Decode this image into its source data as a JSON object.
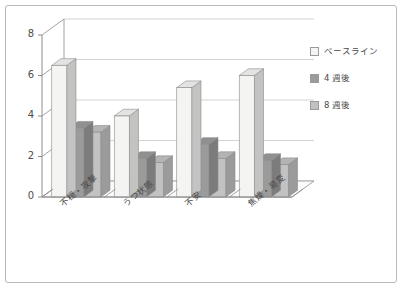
{
  "chart_data": {
    "type": "bar",
    "title": "",
    "subtitle": "",
    "xlabel": "",
    "ylabel": "",
    "ylim": [
      0,
      8
    ],
    "ytick_labels": [
      "0",
      "2",
      "4",
      "6",
      "8"
    ],
    "yticks": [
      0,
      2,
      4,
      6,
      8
    ],
    "grid": true,
    "legend_position": "right",
    "three_d": true,
    "categories": [
      "不穏・攻撃",
      "うつ状態",
      "不安",
      "焦燥・易変"
    ],
    "series": [
      {
        "name": "ベースライン",
        "color": "#f4f4f2",
        "values": [
          6.5,
          4.0,
          5.4,
          6.0
        ]
      },
      {
        "name": "4 週後",
        "color": "#9b9b9b",
        "values": [
          3.4,
          1.9,
          2.6,
          1.8
        ]
      },
      {
        "name": "8 週後",
        "color": "#c2c2c2",
        "values": [
          3.2,
          1.7,
          1.9,
          1.6
        ]
      }
    ]
  },
  "legend": {
    "items": [
      {
        "label": "ベースライン",
        "swatch": "legend-swatch-baseline"
      },
      {
        "label": "4 週後",
        "swatch": "legend-swatch-week4"
      },
      {
        "label": "8 週後",
        "swatch": "legend-swatch-week8"
      }
    ]
  },
  "axis": {
    "y_labels": [
      "8",
      "6",
      "4",
      "2",
      "0"
    ]
  },
  "colors": {
    "border": "#b9b9b9",
    "grid": "#c9c9c9",
    "axis": "#8c8c8c",
    "text": "#4a4a4a",
    "background": "#ffffff",
    "floor": "#fcfcfc"
  }
}
